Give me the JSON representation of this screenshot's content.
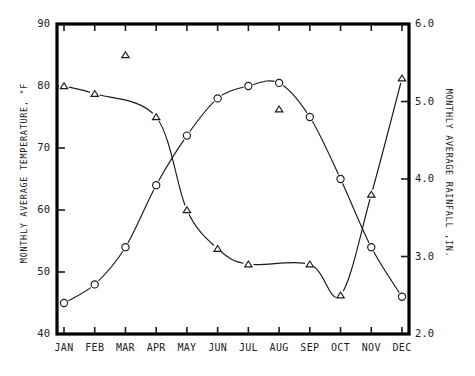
{
  "chart_data": {
    "type": "line",
    "title": "",
    "categories": [
      "JAN",
      "FEB",
      "MAR",
      "APR",
      "MAY",
      "JUN",
      "JUL",
      "AUG",
      "SEP",
      "OCT",
      "NOV",
      "DEC"
    ],
    "series": [
      {
        "name": "Monthly Average Temperature",
        "marker": "circle",
        "axis": "left",
        "unit": "°F",
        "values": [
          45,
          48,
          54,
          64,
          72,
          78,
          80,
          80.5,
          75,
          65,
          54,
          46
        ]
      },
      {
        "name": "Monthly Average Rainfall",
        "marker": "triangle",
        "axis": "right",
        "unit": "IN.",
        "values": [
          5.2,
          5.1,
          5.6,
          4.8,
          3.6,
          3.1,
          2.9,
          4.9,
          2.9,
          2.5,
          3.8,
          5.3
        ]
      }
    ],
    "xlabel": "",
    "ylabel": "MONTHLY AVERAGE TEMPERATURE, °F",
    "y2label": "MONTHLY AVERAGE RAINFALL ,IN.",
    "ylim": [
      40,
      90
    ],
    "y2lim": [
      2.0,
      6.0
    ],
    "yticks": [
      "40",
      "50",
      "60",
      "70",
      "80",
      "90"
    ],
    "y2ticks": [
      "2.0",
      "3.0",
      "4.0",
      "5.0",
      "6.0"
    ],
    "grid": false,
    "legend": "none"
  },
  "axes": {
    "left_title": "MONTHLY AVERAGE TEMPERATURE, °F",
    "right_title": "MONTHLY AVERAGE RAINFALL ,IN.",
    "left_ticks": [
      {
        "label": "90",
        "value": 90
      },
      {
        "label": "80",
        "value": 80
      },
      {
        "label": "70",
        "value": 70
      },
      {
        "label": "60",
        "value": 60
      },
      {
        "label": "50",
        "value": 50
      },
      {
        "label": "40",
        "value": 40
      }
    ],
    "right_ticks": [
      {
        "label": "6.0",
        "value": 6.0
      },
      {
        "label": "5.0",
        "value": 5.0
      },
      {
        "label": "4.0",
        "value": 4.0
      },
      {
        "label": "3.0",
        "value": 3.0
      },
      {
        "label": "2.0",
        "value": 2.0
      }
    ],
    "x_ticks": [
      "JAN",
      "FEB",
      "MAR",
      "APR",
      "MAY",
      "JUN",
      "JUL",
      "AUG",
      "SEP",
      "OCT",
      "NOV",
      "DEC"
    ]
  },
  "colors": {
    "ink": "#1a1a1a",
    "frame": "#000000",
    "background": "#ffffff"
  }
}
